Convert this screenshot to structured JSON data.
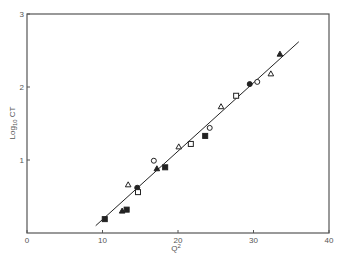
{
  "chart_data": {
    "type": "scatter",
    "title": "",
    "xlabel": "Q²",
    "ylabel": "Log₁₀ CT",
    "xlim": [
      0,
      40
    ],
    "ylim": [
      0,
      3
    ],
    "x_ticks": [
      "0",
      "10",
      "20",
      "30",
      "40"
    ],
    "y_ticks": [
      "1",
      "2",
      "3"
    ],
    "grid": false,
    "legend": null,
    "series": [
      {
        "name": "filled-square",
        "marker": "square",
        "filled": true,
        "points": [
          [
            10.3,
            0.19
          ],
          [
            13.2,
            0.32
          ],
          [
            18.3,
            0.9
          ],
          [
            23.6,
            1.33
          ]
        ]
      },
      {
        "name": "filled-triangle",
        "marker": "triangle",
        "filled": true,
        "points": [
          [
            12.6,
            0.3
          ],
          [
            17.2,
            0.88
          ],
          [
            33.5,
            2.45
          ]
        ]
      },
      {
        "name": "open-triangle",
        "marker": "triangle",
        "filled": false,
        "points": [
          [
            13.4,
            0.66
          ],
          [
            20.1,
            1.18
          ],
          [
            25.7,
            1.73
          ],
          [
            32.3,
            2.18
          ]
        ]
      },
      {
        "name": "filled-circle",
        "marker": "circle",
        "filled": true,
        "points": [
          [
            14.6,
            0.62
          ],
          [
            29.5,
            2.04
          ]
        ]
      },
      {
        "name": "open-square",
        "marker": "square",
        "filled": false,
        "points": [
          [
            14.7,
            0.56
          ],
          [
            21.7,
            1.22
          ],
          [
            27.7,
            1.88
          ]
        ]
      },
      {
        "name": "open-circle",
        "marker": "circle",
        "filled": false,
        "points": [
          [
            16.8,
            0.99
          ],
          [
            24.2,
            1.44
          ],
          [
            30.5,
            2.07
          ]
        ]
      }
    ],
    "fit_line": {
      "x": [
        9.1,
        36.0
      ],
      "y": [
        0.1,
        2.62
      ]
    }
  },
  "axes": {
    "x_title_main": "Q",
    "x_title_sup": "2",
    "y_title_main": "Log",
    "y_title_sub": "10",
    "y_title_rest": " CT"
  },
  "colors": {
    "ink": "#222222",
    "axis": "#555555"
  }
}
